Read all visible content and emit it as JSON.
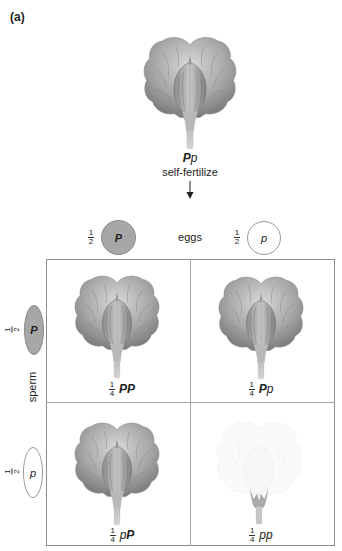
{
  "panel_label": "(a)",
  "parent": {
    "genotype_dominant": "P",
    "genotype_recessive": "p",
    "action": "self-fertilize",
    "arrow_icon": "down-arrow-icon"
  },
  "eggs": {
    "label": "eggs",
    "items": [
      {
        "fraction_num": "1",
        "fraction_den": "2",
        "allele": "P",
        "type": "dominant",
        "fill": "#a7a7a7"
      },
      {
        "fraction_num": "1",
        "fraction_den": "2",
        "allele": "p",
        "type": "recessive",
        "fill": "#ffffff"
      }
    ]
  },
  "sperm": {
    "label": "sperm",
    "items": [
      {
        "fraction_num": "1",
        "fraction_den": "2",
        "allele": "P",
        "type": "dominant",
        "fill": "#a7a7a7"
      },
      {
        "fraction_num": "1",
        "fraction_den": "2",
        "allele": "p",
        "type": "recessive",
        "fill": "#ffffff"
      }
    ]
  },
  "punnett": {
    "cells": [
      {
        "fraction_num": "1",
        "fraction_den": "4",
        "first": "P",
        "first_style": "bold",
        "second": "P",
        "second_style": "bold",
        "phenotype": "purple"
      },
      {
        "fraction_num": "1",
        "fraction_den": "4",
        "first": "P",
        "first_style": "bold",
        "second": "p",
        "second_style": "italic",
        "phenotype": "purple"
      },
      {
        "fraction_num": "1",
        "fraction_den": "4",
        "first": "p",
        "first_style": "italic",
        "second": "P",
        "second_style": "bold",
        "phenotype": "purple"
      },
      {
        "fraction_num": "1",
        "fraction_den": "4",
        "first": "p",
        "first_style": "italic",
        "second": "p",
        "second_style": "italic",
        "phenotype": "white"
      }
    ]
  },
  "colors": {
    "flower_dark": "#7a7a7a",
    "flower_light": "#d6d6d6",
    "flower_white": "#f3f3f3",
    "grid_line": "#8c8c8c",
    "dominant_gamete": "#a7a7a7"
  }
}
